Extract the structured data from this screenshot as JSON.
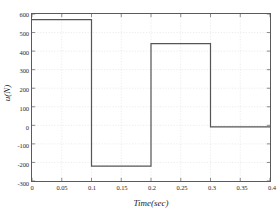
{
  "chart_data": {
    "type": "line",
    "title": "",
    "xlabel": "Time(sec)",
    "ylabel": "u(N)",
    "xlim": [
      0,
      0.4
    ],
    "ylim": [
      -300,
      600
    ],
    "xticks": [
      0,
      0.05,
      0.1,
      0.15,
      0.2,
      0.25,
      0.3,
      0.35,
      0.4
    ],
    "xticklabels": [
      "0",
      "0.05",
      "0.1",
      "0.15",
      "0.2",
      "0.25",
      "0.3",
      "0.35",
      "0.4"
    ],
    "yticks": [
      -300,
      -200,
      -100,
      0,
      100,
      200,
      300,
      400,
      500,
      600
    ],
    "yticklabels": [
      "-300",
      "-200",
      "-100",
      "0",
      "100",
      "200",
      "300",
      "400",
      "500",
      "600"
    ],
    "grid": true,
    "legend": null,
    "series": [
      {
        "name": "u",
        "style": "step-post",
        "color": "#555555",
        "linewidth": 1.2,
        "x": [
          0,
          0.1,
          0.1,
          0.2,
          0.2,
          0.3,
          0.3,
          0.4
        ],
        "y": [
          570,
          570,
          -220,
          -220,
          440,
          440,
          -8,
          -8
        ]
      }
    ],
    "segments": [
      {
        "t_start": 0,
        "t_end": 0.1,
        "value": 570
      },
      {
        "t_start": 0.1,
        "t_end": 0.2,
        "value": -220
      },
      {
        "t_start": 0.2,
        "t_end": 0.3,
        "value": 440
      },
      {
        "t_start": 0.3,
        "t_end": 0.4,
        "value": -8
      }
    ],
    "colors": {
      "line": "#555555",
      "axis": "#5a5a5a",
      "grid": "#d8d8d8",
      "background": "#ffffff",
      "text": "#2b2b2b"
    }
  }
}
